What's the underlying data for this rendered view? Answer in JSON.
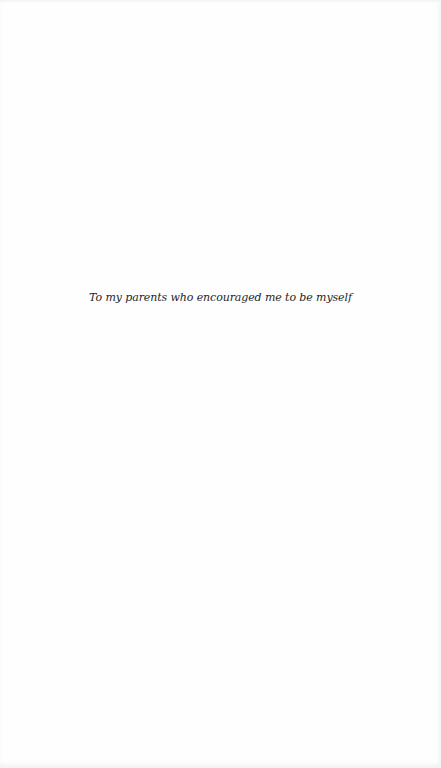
{
  "page": {
    "background": "#fefefe",
    "text_color": "#1e1e1e"
  },
  "dedication": {
    "text": "To my parents who encouraged me to be myself"
  }
}
